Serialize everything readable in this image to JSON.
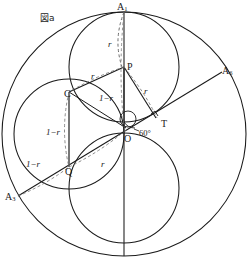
{
  "figure": {
    "caption": "図a",
    "point_labels": [
      {
        "name": "vertex-a1",
        "text": "A",
        "sub": "1",
        "x": 117,
        "y": 2
      },
      {
        "name": "vertex-a6",
        "text": "A",
        "sub": "6",
        "x": 222,
        "y": 66
      },
      {
        "name": "vertex-a3",
        "text": "A",
        "sub": "3",
        "x": 5,
        "y": 192
      },
      {
        "name": "point-p",
        "text": "P",
        "sub": "",
        "x": 127,
        "y": 62
      },
      {
        "name": "point-c",
        "text": "C",
        "sub": "",
        "x": 67,
        "y": 91
      },
      {
        "name": "point-t",
        "text": "T",
        "sub": "",
        "x": 160,
        "y": 120
      },
      {
        "name": "point-o",
        "text": "O",
        "sub": "",
        "x": 125,
        "y": 135
      },
      {
        "name": "point-q",
        "text": "Q",
        "sub": "",
        "x": 75,
        "y": 169
      }
    ],
    "length_labels": [
      {
        "name": "length-r-a1p",
        "text": "r",
        "x": 107,
        "y": 42
      },
      {
        "name": "length-r-pc",
        "text": "r",
        "x": 93,
        "y": 74
      },
      {
        "name": "length-r-pt",
        "text": "r",
        "x": 144,
        "y": 88
      },
      {
        "name": "length-one-minus-r-po",
        "text": "1−r",
        "x": 123,
        "y": 96
      },
      {
        "name": "length-one-minus-r-cq",
        "text": "1−r",
        "x": 53,
        "y": 130
      },
      {
        "name": "length-one-minus-r-a3q",
        "text": "1−r",
        "x": 33,
        "y": 162
      },
      {
        "name": "length-r-qo",
        "text": "r",
        "x": 100,
        "y": 162
      }
    ],
    "angle_labels": [
      {
        "name": "angle-60-degrees",
        "text": "60°",
        "x": 139,
        "y": 130
      }
    ],
    "colors": {
      "stroke": "#1a1a1a",
      "dashed": "#444444",
      "background": "#ffffff"
    },
    "geometry": {
      "outer_circle": {
        "cx": 124,
        "cy": 134,
        "r": 122
      },
      "circle_p": {
        "cx": 124,
        "cy": 67,
        "r": 55
      },
      "circle_q": {
        "cx": 69,
        "cy": 134,
        "r": 55
      },
      "circle_o": {
        "cx": 124,
        "cy": 188,
        "r": 55
      },
      "small_circle_o": {
        "cx": 128,
        "cy": 119,
        "r": 8
      },
      "vertical_axis": {
        "x": 124,
        "y1": 12,
        "y2": 256
      },
      "diagonal_axis": {
        "x1": 18,
        "y1": 196,
        "x2": 222,
        "y2": 72
      }
    }
  }
}
